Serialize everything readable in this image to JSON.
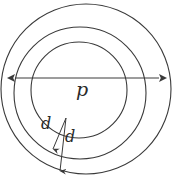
{
  "figure": {
    "kind": "geometry-diagram",
    "background_color": "#ffffff",
    "stroke_color": "#3a3a3a",
    "labels": {
      "pitch_diameter": "p",
      "thickness_outer": "d",
      "thickness_inner": "d"
    },
    "circles": [
      {
        "name": "outer-circle",
        "cx": 86,
        "cy": 89,
        "r": 86
      },
      {
        "name": "middle-circle",
        "cx": 80,
        "cy": 93,
        "r": 66
      },
      {
        "name": "inner-circle",
        "cx": 79,
        "cy": 90,
        "r": 48
      }
    ],
    "dimension_arrow": {
      "name": "pitch-diameter-arrow",
      "x1": 15,
      "y1": 78,
      "x2": 159,
      "y2": 78
    },
    "thickness_arrows": [
      {
        "name": "outer-thickness-arrow",
        "x1": 66,
        "y1": 118,
        "x2": 53,
        "y2": 150
      },
      {
        "name": "inner-thickness-arrow",
        "x1": 66,
        "y1": 118,
        "x2": 60,
        "y2": 172
      }
    ]
  }
}
